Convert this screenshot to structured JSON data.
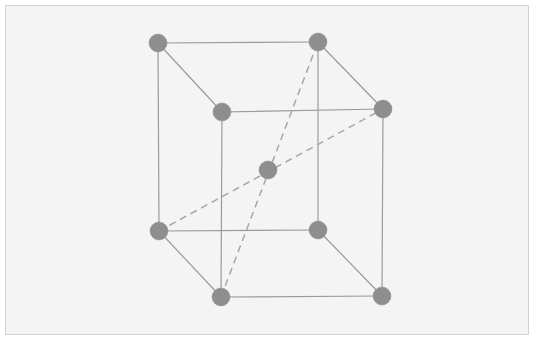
{
  "figure": {
    "kind": "crystal-lattice-diagram",
    "structure_name": "body-centered cubic unit cell",
    "panel": {
      "background_color": "#f4f4f4",
      "border_color": "#d2d2d2",
      "page_background_color": "#ffffff",
      "x": 5,
      "y": 5,
      "width": 524,
      "height": 330
    },
    "style": {
      "atom_color": "#8e8e8e",
      "atom_radius": 9,
      "solid_edge_color": "#9a9a9a",
      "solid_edge_width": 1.2,
      "dashed_edge_color": "#a6a6a6",
      "dashed_edge_width": 1.5,
      "dash_pattern": "7 5"
    }
  },
  "chart_data": {
    "type": "scatter",
    "title": "",
    "xlabel": "",
    "ylabel": "",
    "grid": false,
    "legend": "none",
    "xlim": [
      0,
      535
    ],
    "ylim": [
      0,
      341
    ],
    "atom_count": 9,
    "corner_atom_count": 8,
    "center_atom_count": 1,
    "solid_edge_count": 12,
    "dashed_diagonal_count": 2,
    "nodes": [
      {
        "id": "back-top-left",
        "label": "back top left corner atom",
        "x": 158,
        "y": 43,
        "r": 9,
        "kind": "corner"
      },
      {
        "id": "back-top-right",
        "label": "back top right corner atom",
        "x": 318,
        "y": 42,
        "r": 9,
        "kind": "corner"
      },
      {
        "id": "front-top-left",
        "label": "front top left corner atom",
        "x": 222,
        "y": 112,
        "r": 9,
        "kind": "corner"
      },
      {
        "id": "front-top-right",
        "label": "front top right corner atom",
        "x": 383,
        "y": 109,
        "r": 9,
        "kind": "corner"
      },
      {
        "id": "back-bottom-left",
        "label": "back bottom left corner atom",
        "x": 159,
        "y": 231,
        "r": 9,
        "kind": "corner"
      },
      {
        "id": "back-bottom-right",
        "label": "back bottom right corner atom",
        "x": 318,
        "y": 230,
        "r": 9,
        "kind": "corner"
      },
      {
        "id": "front-bottom-left",
        "label": "front bottom left corner atom",
        "x": 221,
        "y": 297,
        "r": 9,
        "kind": "corner"
      },
      {
        "id": "front-bottom-right",
        "label": "front bottom right corner atom",
        "x": 382,
        "y": 296,
        "r": 9,
        "kind": "corner"
      },
      {
        "id": "body-center",
        "label": "body center atom",
        "x": 268,
        "y": 170,
        "r": 9,
        "kind": "center"
      }
    ],
    "solid_edges": [
      {
        "id": "top-back",
        "from": "back-top-left",
        "to": "back-top-right"
      },
      {
        "id": "top-front",
        "from": "front-top-left",
        "to": "front-top-right"
      },
      {
        "id": "top-left-depth",
        "from": "back-top-left",
        "to": "front-top-left"
      },
      {
        "id": "top-right-depth",
        "from": "back-top-right",
        "to": "front-top-right"
      },
      {
        "id": "bottom-back",
        "from": "back-bottom-left",
        "to": "back-bottom-right"
      },
      {
        "id": "bottom-front",
        "from": "front-bottom-left",
        "to": "front-bottom-right"
      },
      {
        "id": "bottom-left-depth",
        "from": "back-bottom-left",
        "to": "front-bottom-left"
      },
      {
        "id": "bottom-right-depth",
        "from": "back-bottom-right",
        "to": "front-bottom-right"
      },
      {
        "id": "vertical-back-left",
        "from": "back-top-left",
        "to": "back-bottom-left"
      },
      {
        "id": "vertical-back-right",
        "from": "back-top-right",
        "to": "back-bottom-right"
      },
      {
        "id": "vertical-front-left",
        "from": "front-top-left",
        "to": "front-bottom-left"
      },
      {
        "id": "vertical-front-right",
        "from": "front-top-right",
        "to": "front-bottom-right"
      }
    ],
    "dashed_edges": [
      {
        "id": "body-diagonal-1",
        "from": "back-bottom-left",
        "to": "front-top-right",
        "through": "body-center"
      },
      {
        "id": "body-diagonal-2",
        "from": "front-bottom-left",
        "to": "back-top-right",
        "through": "body-center"
      }
    ]
  }
}
